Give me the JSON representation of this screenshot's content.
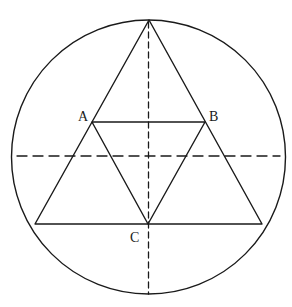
{
  "diagram": {
    "stroke_color": "#1a1a1a",
    "background_color": "#ffffff",
    "circle": {
      "cx": 148.5,
      "cy": 157,
      "r": 137
    },
    "outer_triangle": {
      "apex": {
        "x": 149,
        "y": 20
      },
      "bottom_left": {
        "x": 35,
        "y": 224
      },
      "bottom_right": {
        "x": 262,
        "y": 224
      }
    },
    "points": [
      {
        "label": "A",
        "x": 92,
        "y": 122
      },
      {
        "label": "B",
        "x": 205,
        "y": 122
      },
      {
        "label": "C",
        "x": 148,
        "y": 224
      }
    ],
    "dashed_lines": [
      {
        "name": "vertical-diameter",
        "x1": 148.5,
        "y1": 20,
        "x2": 148.5,
        "y2": 294
      },
      {
        "name": "horizontal-diameter",
        "x1": 17,
        "y1": 156,
        "x2": 280,
        "y2": 156
      }
    ],
    "labels": {
      "a": "A",
      "b": "B",
      "c": "C"
    }
  }
}
